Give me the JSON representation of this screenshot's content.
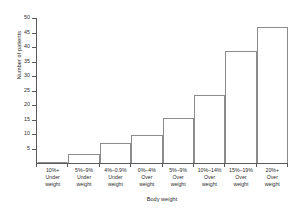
{
  "chart_data": {
    "type": "bar",
    "title": "",
    "xlabel": "Body weight",
    "ylabel": "Number of patients",
    "categories": [
      "10%+ Under weight",
      "5%–9% Under weight",
      "4%–0.9% Under weight",
      "0%–4% Over weight",
      "5%–9% Over weight",
      "10%–14% Over weight",
      "15%–19% Over weight",
      "20%+ Over weight"
    ],
    "category_lines": [
      [
        "10%+",
        "Under",
        "weight"
      ],
      [
        "5%–9%",
        "Under",
        "weight"
      ],
      [
        "4%–0.9%",
        "Under",
        "weight"
      ],
      [
        "0%–4%",
        "Over",
        "weight"
      ],
      [
        "5%–9%",
        "Over",
        "weight"
      ],
      [
        "10%–14%",
        "Over",
        "weight"
      ],
      [
        "15%–19%",
        "Over",
        "weight"
      ],
      [
        "20%+",
        "Over",
        "weight"
      ]
    ],
    "values": [
      0,
      3,
      7,
      9.7,
      15.5,
      23.5,
      38.5,
      47
    ],
    "ylim": [
      0,
      50
    ],
    "yticks": [
      5,
      10,
      15,
      20,
      25,
      30,
      35,
      40,
      45,
      50
    ],
    "ytick_labels": [
      "5",
      "10",
      "15",
      "20",
      "25",
      "30",
      "35",
      "40",
      "45",
      "50"
    ],
    "grid": false,
    "legend": false,
    "bar_fill_color": "#ffffff",
    "bar_border_color": "#8c8c8c",
    "axis_color": "#5a5a5a",
    "text_color": "#2b2b2b",
    "background_color": "#ffffff"
  },
  "caption": {
    "remnant": ""
  }
}
